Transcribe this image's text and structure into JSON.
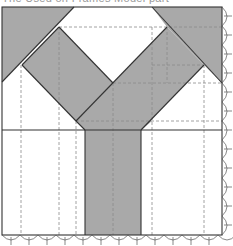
{
  "caption": "The Used on Frames Model part",
  "colors": {
    "fill_gray": "#a9a9a9",
    "line": "#333333",
    "dash": "#8a8a8a",
    "background": "#ffffff"
  },
  "diagram": {
    "type": "folding-pattern / quilt block",
    "frame": {
      "x1": 2,
      "y1": 7,
      "x2": 222,
      "y2": 235
    },
    "shaded_regions": [
      "top-left-triangle",
      "top-right-triangle",
      "left-diagonal-band",
      "right-diagonal-band",
      "vertical-stem"
    ],
    "dashed_vertical_x": [
      21,
      59,
      76,
      113,
      152,
      167,
      204
    ],
    "dashed_horizontal_y": [
      27,
      65,
      83,
      121
    ],
    "solid_horizontal_y": [
      130
    ],
    "scalloped_edges": [
      "bottom",
      "right"
    ]
  }
}
